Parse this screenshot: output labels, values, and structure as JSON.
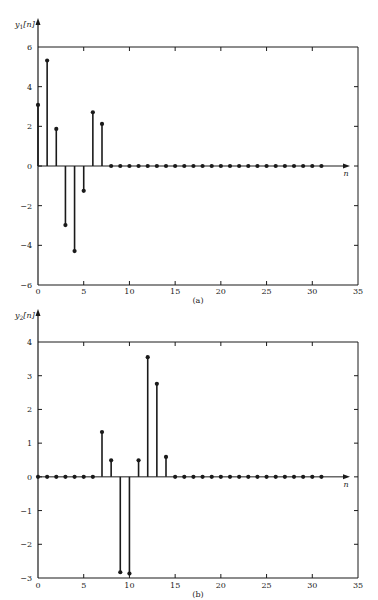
{
  "chart_data": [
    {
      "type": "stem",
      "panel_label": "(a)",
      "ylabel": "y1[n]",
      "ylabel_base": "y",
      "ylabel_sub": "1",
      "ylabel_arg": "[n]",
      "xlabel": "n",
      "xlim": [
        0,
        35
      ],
      "ylim": [
        -6,
        6
      ],
      "xticks": [
        0,
        5,
        10,
        15,
        20,
        25,
        30,
        35
      ],
      "yticks": [
        -6,
        -4,
        -2,
        0,
        2,
        4,
        6
      ],
      "grid": false,
      "x": [
        0,
        1,
        2,
        3,
        4,
        5,
        6,
        7,
        8,
        9,
        10,
        11,
        12,
        13,
        14,
        15,
        16,
        17,
        18,
        19,
        20,
        21,
        22,
        23,
        24,
        25,
        26,
        27,
        28,
        29,
        30,
        31
      ],
      "values": [
        3.08,
        5.32,
        1.87,
        -2.98,
        -4.29,
        -1.25,
        2.71,
        2.12,
        0,
        0,
        0,
        0,
        0,
        0,
        0,
        0,
        0,
        0,
        0,
        0,
        0,
        0,
        0,
        0,
        0,
        0,
        0,
        0,
        0,
        0,
        0,
        0
      ]
    },
    {
      "type": "stem",
      "panel_label": "(b)",
      "ylabel": "y2[n]",
      "ylabel_base": "y",
      "ylabel_sub": "2",
      "ylabel_arg": "[n]",
      "xlabel": "n",
      "xlim": [
        0,
        35
      ],
      "ylim": [
        -3,
        4
      ],
      "xticks": [
        0,
        5,
        10,
        15,
        20,
        25,
        30,
        35
      ],
      "yticks": [
        -3,
        -2,
        -1,
        0,
        1,
        2,
        3,
        4
      ],
      "grid": false,
      "x": [
        0,
        1,
        2,
        3,
        4,
        5,
        6,
        7,
        8,
        9,
        10,
        11,
        12,
        13,
        14,
        15,
        16,
        17,
        18,
        19,
        20,
        21,
        22,
        23,
        24,
        25,
        26,
        27,
        28,
        29,
        30,
        31
      ],
      "values": [
        0,
        0,
        0,
        0,
        0,
        0,
        0,
        1.33,
        0.49,
        -2.83,
        -2.87,
        0.49,
        3.55,
        2.76,
        0.59,
        0,
        0,
        0,
        0,
        0,
        0,
        0,
        0,
        0,
        0,
        0,
        0,
        0,
        0,
        0,
        0,
        0
      ]
    }
  ],
  "layout": {
    "ink": "#1a1a1a",
    "panels": [
      {
        "left": 38,
        "right": 358,
        "top": 47,
        "bottom": 285,
        "axis_arrow_top": 18,
        "zero_arrow_right": 350,
        "xlabel_y": 176,
        "ticklabel_y": 294,
        "caption_y": 303
      },
      {
        "left": 38,
        "right": 358,
        "top": 342,
        "bottom": 578,
        "axis_arrow_top": 309,
        "zero_arrow_right": 350,
        "xlabel_y": 487,
        "ticklabel_y": 588,
        "caption_y": 597
      }
    ]
  }
}
